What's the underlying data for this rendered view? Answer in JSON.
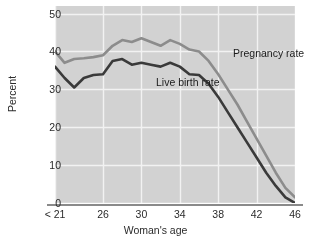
{
  "chart_data": {
    "type": "line",
    "title": "",
    "xlabel": "Woman's age",
    "ylabel": "Percent",
    "x": [
      21,
      22,
      23,
      24,
      25,
      26,
      27,
      28,
      29,
      30,
      31,
      32,
      33,
      34,
      35,
      36,
      37,
      38,
      39,
      40,
      41,
      42,
      43,
      44,
      45,
      46
    ],
    "xtick_labels": [
      "< 21",
      "26",
      "30",
      "34",
      "38",
      "42",
      "46"
    ],
    "xtick_values": [
      21,
      26,
      30,
      34,
      38,
      42,
      46
    ],
    "ytick_labels": [
      "50",
      "40",
      "30",
      "20",
      "10",
      "0"
    ],
    "ytick_values": [
      50,
      40,
      30,
      20,
      10,
      0
    ],
    "xlim": [
      21,
      46
    ],
    "ylim": [
      0,
      52
    ],
    "grid": true,
    "legend_position": "in-plot-annotations",
    "series": [
      {
        "name": "Pregnancy rate",
        "color": "#8c8c8c",
        "values": [
          40.0,
          37.0,
          38.0,
          38.2,
          38.5,
          39.0,
          41.5,
          43.0,
          42.5,
          43.5,
          42.5,
          41.5,
          43.0,
          42.0,
          40.5,
          40.0,
          37.5,
          34.0,
          30.0,
          26.0,
          21.5,
          17.0,
          12.5,
          8.0,
          4.0,
          1.5
        ]
      },
      {
        "name": "Live birth rate",
        "color": "#3a3a3a",
        "values": [
          36.0,
          33.0,
          30.5,
          33.0,
          33.8,
          34.0,
          37.5,
          38.0,
          36.5,
          37.0,
          36.5,
          36.0,
          37.0,
          36.0,
          34.0,
          33.8,
          31.5,
          28.0,
          24.0,
          20.0,
          16.0,
          12.0,
          8.0,
          4.5,
          1.5,
          0.0
        ]
      }
    ],
    "annotations": [
      {
        "text": "Pregnancy rate",
        "series": "Pregnancy rate"
      },
      {
        "text": "Live birth rate",
        "series": "Live birth rate"
      }
    ],
    "colors": {
      "plot_background": "#d2d2d2",
      "gridline": "#f2f2f2",
      "axis_line": "#8a8a8a",
      "text": "#2b2b2b",
      "pregnancy_line": "#8c8c8c",
      "livebirth_line": "#3a3a3a"
    }
  }
}
